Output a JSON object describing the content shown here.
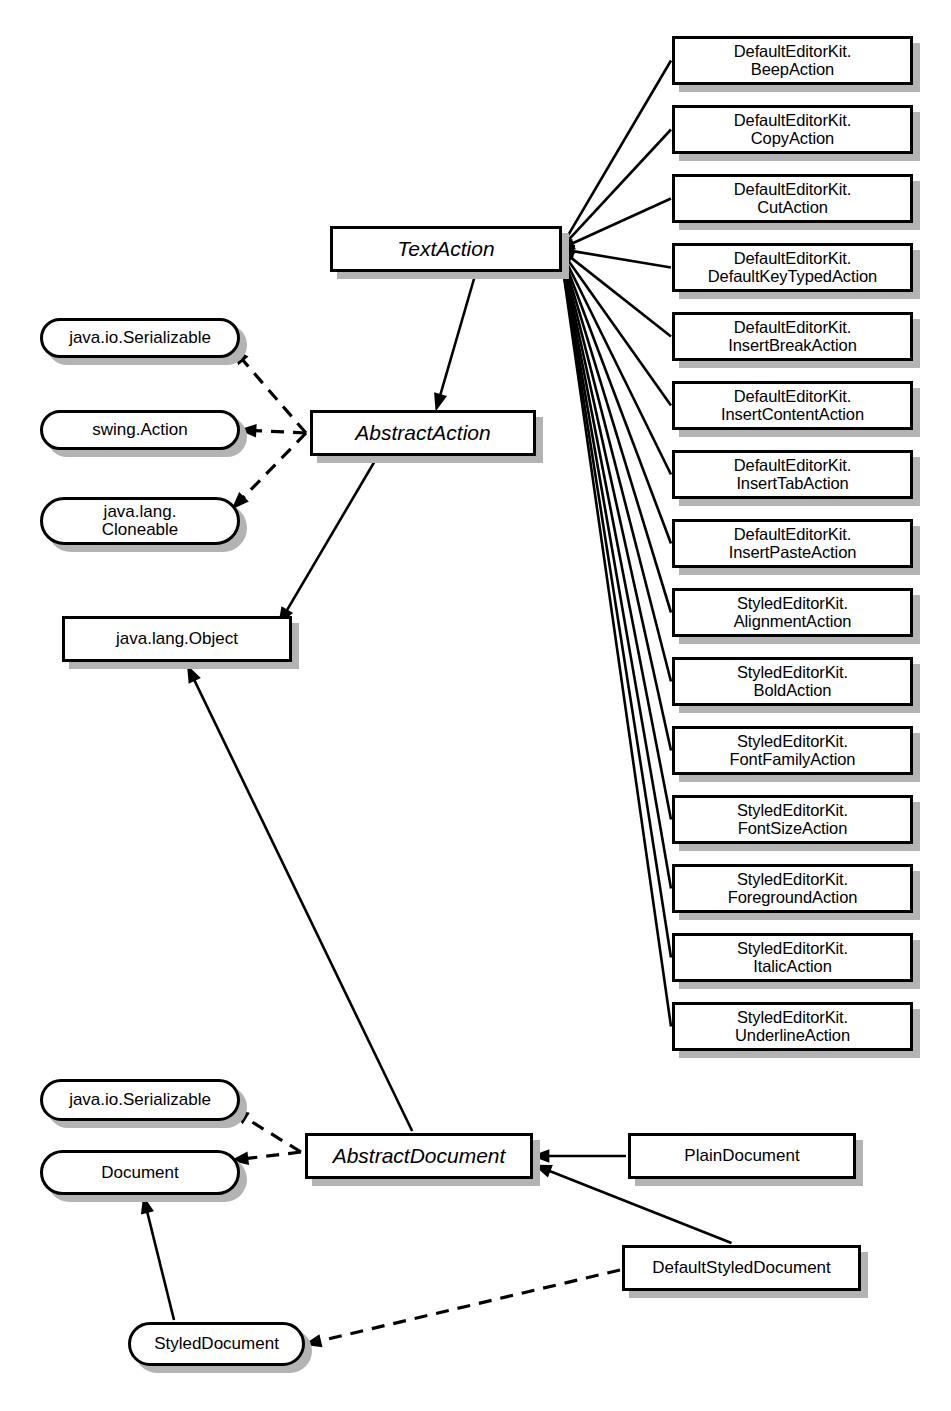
{
  "diagram": {
    "style": {
      "node_fill": "#ffffff",
      "node_border": "#000000",
      "node_shadow": "#b3b3b3",
      "edge_color": "#000000",
      "background": "#ffffff"
    }
  },
  "nodes": [
    {
      "id": "textaction",
      "label": "TextAction",
      "kind": "abstract-class",
      "x": 330,
      "y": 226,
      "w": 232,
      "h": 46
    },
    {
      "id": "abstractaction",
      "label": "AbstractAction",
      "kind": "abstract-class",
      "x": 310,
      "y": 410,
      "w": 226,
      "h": 46
    },
    {
      "id": "javalangobject",
      "label": "java.lang.Object",
      "kind": "class",
      "x": 62,
      "y": 616,
      "w": 230,
      "h": 46
    },
    {
      "id": "abstractdocument",
      "label": "AbstractDocument",
      "kind": "abstract-class",
      "x": 305,
      "y": 1133,
      "w": 228,
      "h": 46
    },
    {
      "id": "plaindocument",
      "label": "PlainDocument",
      "kind": "class",
      "x": 628,
      "y": 1133,
      "w": 228,
      "h": 46
    },
    {
      "id": "defaultstyleddocument",
      "label": "DefaultStyledDocument",
      "kind": "class",
      "x": 622,
      "y": 1245,
      "w": 239,
      "h": 46
    },
    {
      "id": "iface-serializable-1",
      "label": "java.io.Serializable",
      "kind": "interface",
      "x": 40,
      "y": 318,
      "w": 200,
      "h": 40
    },
    {
      "id": "iface-swing-action",
      "label": "swing.Action",
      "kind": "interface",
      "x": 40,
      "y": 410,
      "w": 200,
      "h": 40
    },
    {
      "id": "iface-cloneable",
      "label": "java.lang.\nCloneable",
      "kind": "interface",
      "x": 40,
      "y": 497,
      "w": 200,
      "h": 48
    },
    {
      "id": "iface-serializable-2",
      "label": "java.io.Serializable",
      "kind": "interface",
      "x": 40,
      "y": 1079,
      "w": 200,
      "h": 42
    },
    {
      "id": "iface-document",
      "label": "Document",
      "kind": "interface",
      "x": 40,
      "y": 1150,
      "w": 200,
      "h": 45
    },
    {
      "id": "iface-styleddocument",
      "label": "StyledDocument",
      "kind": "interface",
      "x": 128,
      "y": 1322,
      "w": 177,
      "h": 44
    },
    {
      "id": "leaf-0",
      "label": "DefaultEditorKit.\nBeepAction",
      "kind": "leaf-class",
      "x": 672,
      "y": 36,
      "w": 241,
      "h": 49
    },
    {
      "id": "leaf-1",
      "label": "DefaultEditorKit.\nCopyAction",
      "kind": "leaf-class",
      "x": 672,
      "y": 105,
      "w": 241,
      "h": 49
    },
    {
      "id": "leaf-2",
      "label": "DefaultEditorKit.\nCutAction",
      "kind": "leaf-class",
      "x": 672,
      "y": 174,
      "w": 241,
      "h": 49
    },
    {
      "id": "leaf-3",
      "label": "DefaultEditorKit.\nDefaultKeyTypedAction",
      "kind": "leaf-class",
      "x": 672,
      "y": 243,
      "w": 241,
      "h": 49
    },
    {
      "id": "leaf-4",
      "label": "DefaultEditorKit.\nInsertBreakAction",
      "kind": "leaf-class",
      "x": 672,
      "y": 312,
      "w": 241,
      "h": 49
    },
    {
      "id": "leaf-5",
      "label": "DefaultEditorKit.\nInsertContentAction",
      "kind": "leaf-class",
      "x": 672,
      "y": 381,
      "w": 241,
      "h": 49
    },
    {
      "id": "leaf-6",
      "label": "DefaultEditorKit.\nInsertTabAction",
      "kind": "leaf-class",
      "x": 672,
      "y": 450,
      "w": 241,
      "h": 49
    },
    {
      "id": "leaf-7",
      "label": "DefaultEditorKit.\nInsertPasteAction",
      "kind": "leaf-class",
      "x": 672,
      "y": 519,
      "w": 241,
      "h": 49
    },
    {
      "id": "leaf-8",
      "label": "StyledEditorKit.\nAlignmentAction",
      "kind": "leaf-class",
      "x": 672,
      "y": 588,
      "w": 241,
      "h": 49
    },
    {
      "id": "leaf-9",
      "label": "StyledEditorKit.\nBoldAction",
      "kind": "leaf-class",
      "x": 672,
      "y": 657,
      "w": 241,
      "h": 49
    },
    {
      "id": "leaf-10",
      "label": "StyledEditorKit.\nFontFamilyAction",
      "kind": "leaf-class",
      "x": 672,
      "y": 726,
      "w": 241,
      "h": 49
    },
    {
      "id": "leaf-11",
      "label": "StyledEditorKit.\nFontSizeAction",
      "kind": "leaf-class",
      "x": 672,
      "y": 795,
      "w": 241,
      "h": 49
    },
    {
      "id": "leaf-12",
      "label": "StyledEditorKit.\nForegroundAction",
      "kind": "leaf-class",
      "x": 672,
      "y": 864,
      "w": 241,
      "h": 49
    },
    {
      "id": "leaf-13",
      "label": "StyledEditorKit.\nItalicAction",
      "kind": "leaf-class",
      "x": 672,
      "y": 933,
      "w": 241,
      "h": 49
    },
    {
      "id": "leaf-14",
      "label": "StyledEditorKit.\nUnderlineAction",
      "kind": "leaf-class",
      "x": 672,
      "y": 1002,
      "w": 241,
      "h": 49
    }
  ],
  "edges": [
    {
      "id": "e-leaf-0",
      "from": "leaf-0",
      "to": "textaction",
      "relation": "generalization",
      "style": "solid"
    },
    {
      "id": "e-leaf-1",
      "from": "leaf-1",
      "to": "textaction",
      "relation": "generalization",
      "style": "solid"
    },
    {
      "id": "e-leaf-2",
      "from": "leaf-2",
      "to": "textaction",
      "relation": "generalization",
      "style": "solid"
    },
    {
      "id": "e-leaf-3",
      "from": "leaf-3",
      "to": "textaction",
      "relation": "generalization",
      "style": "solid"
    },
    {
      "id": "e-leaf-4",
      "from": "leaf-4",
      "to": "textaction",
      "relation": "generalization",
      "style": "solid"
    },
    {
      "id": "e-leaf-5",
      "from": "leaf-5",
      "to": "textaction",
      "relation": "generalization",
      "style": "solid"
    },
    {
      "id": "e-leaf-6",
      "from": "leaf-6",
      "to": "textaction",
      "relation": "generalization",
      "style": "solid"
    },
    {
      "id": "e-leaf-7",
      "from": "leaf-7",
      "to": "textaction",
      "relation": "generalization",
      "style": "solid"
    },
    {
      "id": "e-leaf-8",
      "from": "leaf-8",
      "to": "textaction",
      "relation": "generalization",
      "style": "solid"
    },
    {
      "id": "e-leaf-9",
      "from": "leaf-9",
      "to": "textaction",
      "relation": "generalization",
      "style": "solid"
    },
    {
      "id": "e-leaf-10",
      "from": "leaf-10",
      "to": "textaction",
      "relation": "generalization",
      "style": "solid"
    },
    {
      "id": "e-leaf-11",
      "from": "leaf-11",
      "to": "textaction",
      "relation": "generalization",
      "style": "solid"
    },
    {
      "id": "e-leaf-12",
      "from": "leaf-12",
      "to": "textaction",
      "relation": "generalization",
      "style": "solid"
    },
    {
      "id": "e-leaf-13",
      "from": "leaf-13",
      "to": "textaction",
      "relation": "generalization",
      "style": "solid"
    },
    {
      "id": "e-leaf-14",
      "from": "leaf-14",
      "to": "textaction",
      "relation": "generalization",
      "style": "solid"
    },
    {
      "id": "e-textaction-abstractaction",
      "from": "textaction",
      "to": "abstractaction",
      "relation": "generalization",
      "style": "solid"
    },
    {
      "id": "e-abstractaction-object",
      "from": "abstractaction",
      "to": "javalangobject",
      "relation": "generalization",
      "style": "solid"
    },
    {
      "id": "e-abstractaction-serializable",
      "from": "abstractaction",
      "to": "iface-serializable-1",
      "relation": "realization",
      "style": "dashed"
    },
    {
      "id": "e-abstractaction-swingaction",
      "from": "abstractaction",
      "to": "iface-swing-action",
      "relation": "realization",
      "style": "dashed"
    },
    {
      "id": "e-abstractaction-cloneable",
      "from": "abstractaction",
      "to": "iface-cloneable",
      "relation": "realization",
      "style": "dashed"
    },
    {
      "id": "e-abstractdocument-object",
      "from": "abstractdocument",
      "to": "javalangobject",
      "relation": "generalization",
      "style": "solid"
    },
    {
      "id": "e-abstractdocument-serializable",
      "from": "abstractdocument",
      "to": "iface-serializable-2",
      "relation": "realization",
      "style": "dashed"
    },
    {
      "id": "e-abstractdocument-document",
      "from": "abstractdocument",
      "to": "iface-document",
      "relation": "realization",
      "style": "dashed"
    },
    {
      "id": "e-plaindocument-abstractdocument",
      "from": "plaindocument",
      "to": "abstractdocument",
      "relation": "generalization",
      "style": "solid"
    },
    {
      "id": "e-defaultstyleddocument-abstractdocument",
      "from": "defaultstyleddocument",
      "to": "abstractdocument",
      "relation": "generalization",
      "style": "solid"
    },
    {
      "id": "e-defaultstyleddocument-styleddocument",
      "from": "defaultstyleddocument",
      "to": "iface-styleddocument",
      "relation": "realization",
      "style": "dashed"
    },
    {
      "id": "e-styleddocument-document",
      "from": "iface-styleddocument",
      "to": "iface-document",
      "relation": "generalization",
      "style": "solid"
    }
  ]
}
